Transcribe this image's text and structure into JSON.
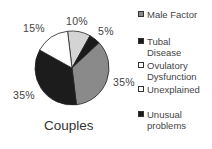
{
  "chart_data": {
    "type": "pie",
    "title": "Couples",
    "categories": [
      "Male Factor",
      "Tubal Disease",
      "Ovulatory Dysfunction",
      "Unexplained",
      "Unusual problems"
    ],
    "slices": [
      {
        "label": "10%",
        "value": 10,
        "color": "#d4d4d4"
      },
      {
        "label": "5%",
        "value": 5,
        "color": "#1a1a1a"
      },
      {
        "label": "35%",
        "value": 35,
        "color": "#8a8a8a"
      },
      {
        "label": "35%",
        "value": 35,
        "color": "#1c1c1c"
      },
      {
        "label": "15%",
        "value": 15,
        "color": "#ffffff"
      }
    ],
    "legend_position": "right"
  },
  "title": "Couples",
  "labels": {
    "l10": "10%",
    "l5": "5%",
    "l35r": "35%",
    "l35l": "35%",
    "l15": "15%"
  },
  "legend": [
    {
      "label_1": "Male  Factor",
      "label_2": "",
      "color": "#8a8a8a"
    },
    {
      "label_1": "Tubal",
      "label_2": "Disease",
      "color": "#1a1a1a"
    },
    {
      "label_1": "Ovulatory",
      "label_2": "Dysfunction",
      "color": "#ffffff"
    },
    {
      "label_1": "Unexplained",
      "label_2": "",
      "color": "#ffffff"
    },
    {
      "label_1": "Unusual",
      "label_2": "problems",
      "color": "#1a1a1a"
    }
  ]
}
